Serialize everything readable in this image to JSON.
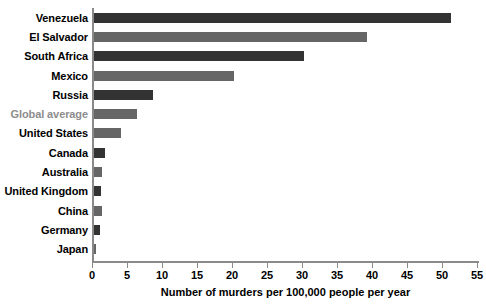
{
  "chart_data": {
    "type": "bar",
    "orientation": "horizontal",
    "title": "",
    "xlabel": "Number of murders per 100,000 people per year",
    "ylabel": "",
    "xlim": [
      0,
      55
    ],
    "xticks": [
      0,
      5,
      10,
      15,
      20,
      25,
      30,
      35,
      40,
      45,
      50,
      55
    ],
    "xtick_labels": [
      "0",
      "5",
      "10",
      "15",
      "20",
      "25",
      "30",
      "35",
      "40",
      "45",
      "50",
      "55"
    ],
    "grid": false,
    "legend": null,
    "categories": [
      "Venezuela",
      "El Salvador",
      "South Africa",
      "Mexico",
      "Russia",
      "Global average",
      "United States",
      "Canada",
      "Australia",
      "United Kingdom",
      "China",
      "Germany",
      "Japan"
    ],
    "values": [
      51,
      39,
      30,
      20,
      8.4,
      6.2,
      3.8,
      1.5,
      1.1,
      1.0,
      1.1,
      0.8,
      0.3
    ],
    "bar_colors": [
      "#333333",
      "#666666",
      "#333333",
      "#666666",
      "#333333",
      "#666666",
      "#666666",
      "#333333",
      "#666666",
      "#333333",
      "#666666",
      "#333333",
      "#666666"
    ],
    "label_colors": [
      "#000000",
      "#000000",
      "#000000",
      "#000000",
      "#000000",
      "#8d8d8d",
      "#000000",
      "#000000",
      "#000000",
      "#000000",
      "#000000",
      "#000000",
      "#000000"
    ],
    "highlighted_category": "Global average",
    "axis_color": "#8a8a8a"
  }
}
